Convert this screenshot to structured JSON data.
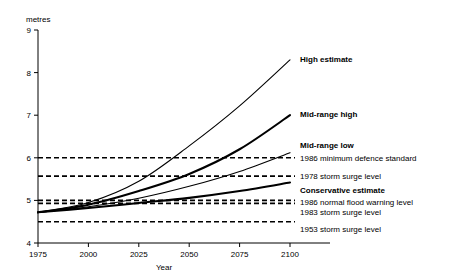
{
  "chart_data": {
    "type": "line",
    "title": "",
    "xlabel": "Year",
    "ylabel": "metres",
    "xlim": [
      1975,
      2100
    ],
    "ylim": [
      4,
      9
    ],
    "grid": false,
    "legend_position": "right-inline",
    "x_ticks": [
      "1975",
      "2000",
      "2025",
      "2050",
      "2075",
      "2100"
    ],
    "x_tick_values": [
      1975,
      2000,
      2025,
      2050,
      2075,
      2100
    ],
    "y_ticks": [
      "4",
      "5",
      "6",
      "7",
      "8",
      "9"
    ],
    "y_tick_values": [
      4,
      5,
      6,
      7,
      8,
      9
    ],
    "x": [
      1975,
      2000,
      2025,
      2050,
      2075,
      2100
    ],
    "series": [
      {
        "name": "High estimate",
        "style": "solid",
        "stroke_width": 1.1,
        "values": [
          4.72,
          4.95,
          5.45,
          6.28,
          7.22,
          8.3
        ],
        "label_y": 8.33
      },
      {
        "name": "Mid-range high",
        "style": "solid",
        "stroke_width": 2.1,
        "values": [
          4.72,
          4.9,
          5.22,
          5.62,
          6.2,
          7.0
        ],
        "label_y": 7.03
      },
      {
        "name": "Mid-range low",
        "style": "solid",
        "stroke_width": 1.1,
        "values": [
          4.72,
          4.85,
          5.05,
          5.33,
          5.68,
          6.12
        ],
        "label_y": 6.3
      },
      {
        "name": "Conservative estimate",
        "style": "solid",
        "stroke_width": 2.1,
        "values": [
          4.72,
          4.82,
          4.94,
          5.06,
          5.22,
          5.42
        ],
        "label_y": 5.45
      }
    ],
    "reference_lines": [
      {
        "name": "1986 minimum defence standard",
        "value": 6.0,
        "style": "dashed"
      },
      {
        "name": "1978 storm surge level",
        "value": 5.57,
        "style": "dashed"
      },
      {
        "name": "1986 normal flood warning level",
        "value": 5.0,
        "style": "dashed"
      },
      {
        "name": "1983 storm surge level",
        "value": 4.93,
        "style": "dashed"
      },
      {
        "name": "1953 storm surge level",
        "value": 4.5,
        "style": "dashed"
      }
    ],
    "right_labels": [
      {
        "text": "High estimate",
        "bold": true,
        "y": 8.33
      },
      {
        "text": "Mid-range high",
        "bold": true,
        "y": 7.03
      },
      {
        "text": "Mid-range low",
        "bold": true,
        "y": 6.3
      },
      {
        "text": "1986 minimum defence standard",
        "bold": false,
        "y": 6.0
      },
      {
        "text": "1978 storm surge level",
        "bold": false,
        "y": 5.57
      },
      {
        "text": "Conservative estimate",
        "bold": true,
        "y": 5.25
      },
      {
        "text": "1986 normal flood warning level",
        "bold": false,
        "y": 4.97
      },
      {
        "text": "1983 storm surge level",
        "bold": false,
        "y": 4.72
      },
      {
        "text": "1953 storm surge level",
        "bold": false,
        "y": 4.33
      }
    ]
  }
}
